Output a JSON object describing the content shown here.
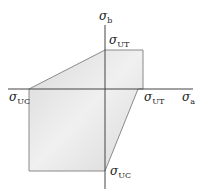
{
  "diagram": {
    "colors": {
      "fill": "#d9d9d9",
      "fill_light": "#f0f0f0",
      "edge": "#8a8a8a",
      "axis": "#444444"
    },
    "axes": {
      "x": {
        "symbol": "σ",
        "subscript": "a"
      },
      "y": {
        "symbol": "σ",
        "subscript": "b"
      }
    },
    "labels": {
      "top": {
        "symbol": "σ",
        "subscript": "UT"
      },
      "right": {
        "symbol": "σ",
        "subscript": "UT"
      },
      "left": {
        "symbol": "σ",
        "subscript": "UC"
      },
      "bottom": {
        "symbol": "σ",
        "subscript": "UC"
      }
    }
  }
}
